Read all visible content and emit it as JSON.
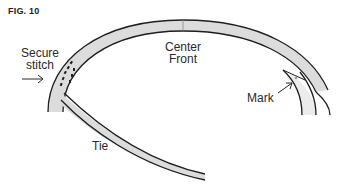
{
  "figure": {
    "label": "FIG. 10"
  },
  "labels": {
    "secure_line1": "Secure",
    "secure_line2": "stitch",
    "center_line1": "Center",
    "center_line2": "Front",
    "mark": "Mark",
    "tie": "Tie"
  },
  "colors": {
    "band_fill": "#dcdcdc",
    "stroke": "#1e1e1e",
    "text": "#2a2a2a",
    "background": "#ffffff"
  }
}
